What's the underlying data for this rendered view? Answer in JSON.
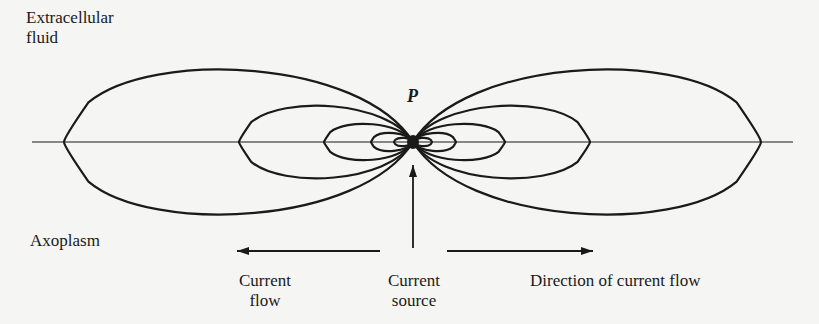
{
  "labels": {
    "extracellular_line1": "Extracellular",
    "extracellular_line2": "fluid",
    "point": "P",
    "axoplasm": "Axoplasm",
    "current_flow_line1": "Current",
    "current_flow_line2": "flow",
    "current_source_line1": "Current",
    "current_source_line2": "source",
    "direction": "Direction of current flow"
  },
  "geometry": {
    "center": [
      413,
      142
    ],
    "axis": {
      "x1": 32,
      "x2": 793,
      "y": 142
    },
    "left_loops_leftmost_x": [
      64,
      239,
      324,
      371,
      394
    ],
    "right_loops_rightmost_x": [
      761,
      590,
      505,
      456,
      432
    ],
    "loop_half_heights": [
      88,
      44,
      22,
      11,
      5
    ],
    "source_arrow": {
      "x": 413,
      "y1": 248,
      "y2": 165
    },
    "left_arrow": {
      "x1": 380,
      "x2": 237,
      "y": 251
    },
    "right_arrow": {
      "x1": 447,
      "x2": 593,
      "y": 251
    }
  },
  "colors": {
    "ink": "#1a1a1a",
    "background": "#f5f5f3"
  }
}
